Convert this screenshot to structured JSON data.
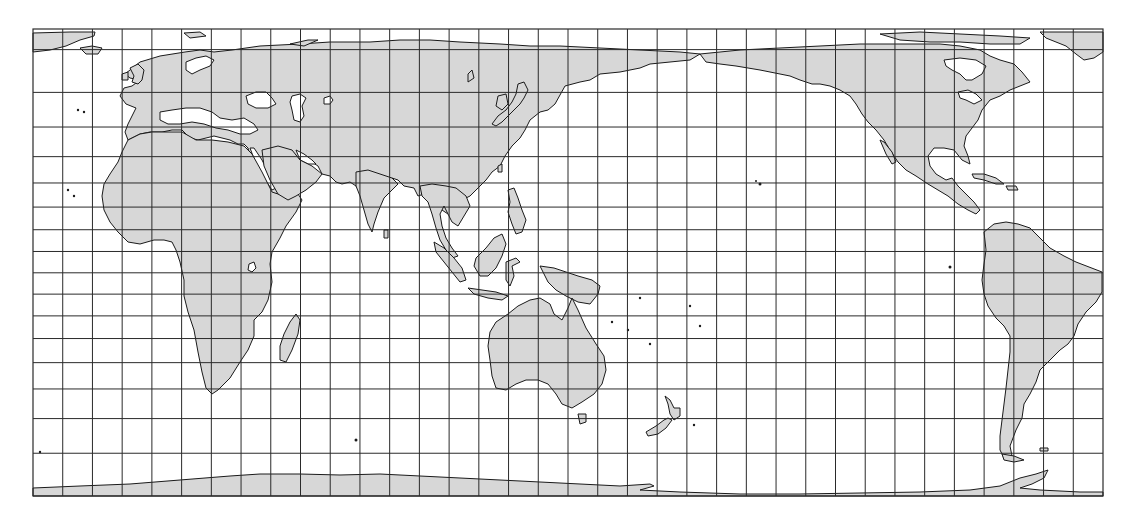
{
  "map": {
    "title": "",
    "projection": "cylindrical (Miller-like), Pacific-centered",
    "fill_colors": {
      "land": "#d7d7d7",
      "ocean": "#ffffff",
      "coastline": "#1a1a1a",
      "graticule": "#2a2a2a"
    },
    "extent": {
      "lon_min": -30,
      "lon_max": 330,
      "lat_max": 84,
      "lat_min": -80
    },
    "graticule": {
      "lon_step_deg": 10,
      "lat_lines_deg": [
        80,
        70,
        60,
        50,
        40,
        30,
        20,
        10,
        0,
        -10,
        -20,
        -30,
        -40,
        -50,
        -60,
        -70
      ]
    },
    "landmasses": [
      {
        "name": "Eurasia"
      },
      {
        "name": "Africa"
      },
      {
        "name": "Arabian Peninsula"
      },
      {
        "name": "Indian Subcontinent"
      },
      {
        "name": "Southeast Asia"
      },
      {
        "name": "Japan"
      },
      {
        "name": "Borneo"
      },
      {
        "name": "Sumatra"
      },
      {
        "name": "Java"
      },
      {
        "name": "Sulawesi"
      },
      {
        "name": "Philippines"
      },
      {
        "name": "New Guinea"
      },
      {
        "name": "Australia"
      },
      {
        "name": "Tasmania"
      },
      {
        "name": "New Zealand"
      },
      {
        "name": "Madagascar"
      },
      {
        "name": "Great Britain"
      },
      {
        "name": "Iceland"
      },
      {
        "name": "North America"
      },
      {
        "name": "Greenland"
      },
      {
        "name": "Cuba"
      },
      {
        "name": "South America"
      },
      {
        "name": "Antarctica"
      },
      {
        "name": "Sri Lanka"
      }
    ]
  }
}
